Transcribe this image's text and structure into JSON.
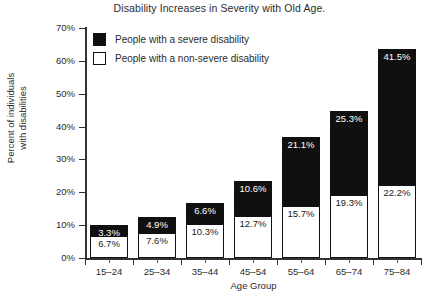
{
  "chart_data": {
    "type": "bar",
    "subtype": "stacked-bar",
    "title": "Disability Increases in Severity with Old Age.",
    "xlabel": "Age Group",
    "ylabel_lines": [
      "Percent of individuals",
      "with disabilities"
    ],
    "ylabel": "Percent of individuals with disabilities",
    "categories": [
      "15–24",
      "25–34",
      "35–44",
      "45–54",
      "55–64",
      "65–74",
      "75–84"
    ],
    "ylim": [
      0,
      70
    ],
    "ytick_values": [
      0,
      10,
      20,
      30,
      40,
      50,
      60,
      70
    ],
    "ytick_labels": [
      "0%",
      "10%",
      "20%",
      "30%",
      "40%",
      "50%",
      "60%",
      "70%"
    ],
    "grid": false,
    "legend_position": "inside-top-left",
    "series": [
      {
        "name": "People with a non-severe disability",
        "color": "#ffffff",
        "stack_order": "bottom",
        "values": [
          6.7,
          7.6,
          10.3,
          12.7,
          15.7,
          19.3,
          22.2
        ],
        "labels": [
          "6.7%",
          "7.6%",
          "10.3%",
          "12.7%",
          "15.7%",
          "19.3%",
          "22.2%"
        ]
      },
      {
        "name": "People with a severe disability",
        "color": "#101010",
        "stack_order": "top",
        "values": [
          3.3,
          4.9,
          6.6,
          10.6,
          21.1,
          25.3,
          41.5
        ],
        "labels": [
          "3.3%",
          "4.9%",
          "6.6%",
          "10.6%",
          "21.1%",
          "25.3%",
          "41.5%"
        ]
      }
    ],
    "totals": [
      10.0,
      12.5,
      16.9,
      23.3,
      36.8,
      44.6,
      63.7
    ]
  },
  "legend": {
    "items": [
      {
        "label": "People with a severe disability",
        "swatch": "filled-black-square"
      },
      {
        "label": "People with a non-severe disability",
        "swatch": "outlined-white-square"
      }
    ]
  },
  "colors": {
    "severe": "#101010",
    "non_severe": "#ffffff",
    "axis": "#333333",
    "text": "#2b2b2b",
    "background": "#ffffff"
  }
}
